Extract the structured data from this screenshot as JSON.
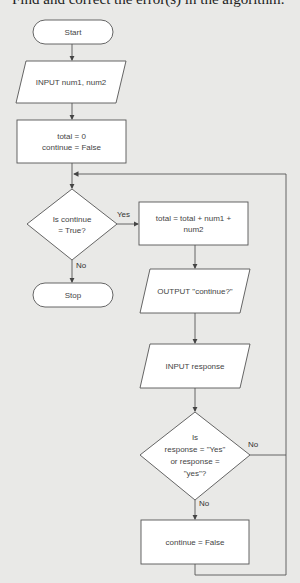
{
  "heading": "Find and correct the error(s) in the algorithm.",
  "flowchart": {
    "nodes": {
      "start": {
        "type": "terminator",
        "label": "Start"
      },
      "input_nums": {
        "type": "io",
        "label": "INPUT num1, num2"
      },
      "init": {
        "type": "process",
        "line1": "total = 0",
        "line2": "continue = False"
      },
      "check_continue": {
        "type": "decision",
        "line1": "Is continue",
        "line2": "= True?"
      },
      "stop": {
        "type": "terminator",
        "label": "Stop"
      },
      "add_total": {
        "type": "process",
        "line1": "total = total + num1 +",
        "line2": "num2"
      },
      "output_continue": {
        "type": "io",
        "label": "OUTPUT \"continue?\""
      },
      "input_response": {
        "type": "io",
        "label": "INPUT response"
      },
      "check_response": {
        "type": "decision",
        "line1": "Is",
        "line2": "response = \"Yes\"",
        "line3": "or response =",
        "line4": "\"yes\"?"
      },
      "set_false": {
        "type": "process",
        "label": "continue = False"
      }
    },
    "edges": {
      "check_continue_yes": "Yes",
      "check_continue_no": "No",
      "check_response_no_right": "No",
      "check_response_no_down": "No"
    },
    "colors": {
      "background": "#e9e9e7",
      "shape_fill": "#ffffff",
      "stroke": "#555555",
      "text": "#444444"
    }
  }
}
